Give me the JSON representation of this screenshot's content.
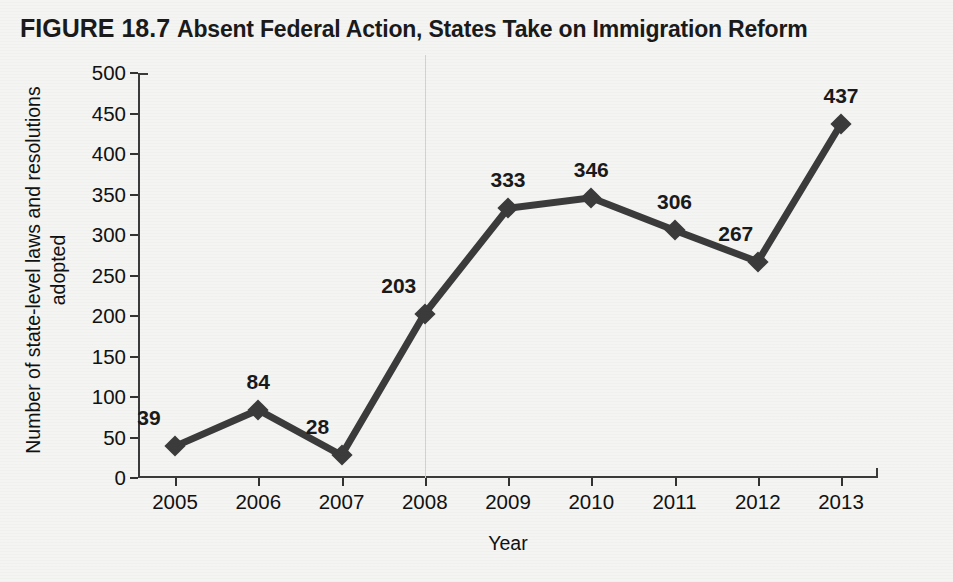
{
  "figure": {
    "number": "FIGURE 18.7",
    "title": "Absent Federal Action, States Take on Immigration Reform"
  },
  "colors": {
    "background": "#f4f4f3",
    "series": "#3b3b3b",
    "axis": "#3b3b3b",
    "text": "#1a1a1a",
    "reference_line": "#d2d2d2"
  },
  "chart_data": {
    "type": "line",
    "title": "Absent Federal Action, States Take on Immigration Reform",
    "xlabel": "Year",
    "ylabel": "Number of state-level laws and resolutions\nadopted",
    "categories": [
      "2005",
      "2006",
      "2007",
      "2008",
      "2009",
      "2010",
      "2011",
      "2012",
      "2013"
    ],
    "values": [
      39,
      84,
      28,
      203,
      333,
      346,
      306,
      267,
      437
    ],
    "point_labels": [
      "39",
      "84",
      "28",
      "203",
      "333",
      "346",
      "306",
      "267",
      "437"
    ],
    "ylim": [
      0,
      500
    ],
    "ytick_labels": [
      "0",
      "50",
      "100",
      "150",
      "200",
      "250",
      "300",
      "350",
      "400",
      "450",
      "500"
    ],
    "yticks": [
      0,
      50,
      100,
      150,
      200,
      250,
      300,
      350,
      400,
      450,
      500
    ],
    "grid": false,
    "legend": null,
    "marker": "diamond",
    "annotations": [
      {
        "name": "reference-line-2008",
        "x": "2008",
        "style": "vertical light gray line"
      }
    ]
  }
}
